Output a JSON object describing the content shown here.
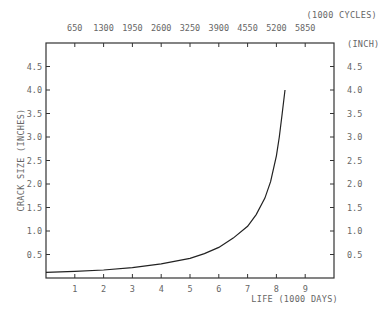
{
  "chart_data": {
    "type": "line",
    "title": "",
    "xlabel": "LIFE (1000 DAYS)",
    "x2label": "(1000 CYCLES)",
    "ylabel": "CRACK SIZE (INCHES)",
    "y2label": "(INCH)",
    "xlim": [
      0,
      10
    ],
    "ylim": [
      0,
      5
    ],
    "x_ticks": [
      1,
      2,
      3,
      4,
      5,
      6,
      7,
      8,
      9
    ],
    "x2_ticks": [
      650,
      1300,
      1950,
      2600,
      3250,
      3900,
      4550,
      5200,
      5850
    ],
    "y_ticks": [
      "0.5",
      "1.0",
      "1.5",
      "2.0",
      "2.5",
      "3.0",
      "3.5",
      "4.0",
      "4.5"
    ],
    "y2_ticks": [
      "0.5",
      "1.0",
      "1.5",
      "2.0",
      "2.5",
      "3.0",
      "3.5",
      "4.0",
      "4.5"
    ],
    "grid": false,
    "legend": null,
    "series": [
      {
        "name": "crack growth",
        "x": [
          0,
          1,
          2,
          3,
          4,
          5,
          5.5,
          6,
          6.5,
          7,
          7.3,
          7.6,
          7.8,
          8.0,
          8.1,
          8.2,
          8.3
        ],
        "y": [
          0.12,
          0.14,
          0.17,
          0.22,
          0.3,
          0.42,
          0.52,
          0.65,
          0.85,
          1.1,
          1.35,
          1.7,
          2.05,
          2.6,
          3.0,
          3.5,
          4.0
        ]
      }
    ]
  }
}
